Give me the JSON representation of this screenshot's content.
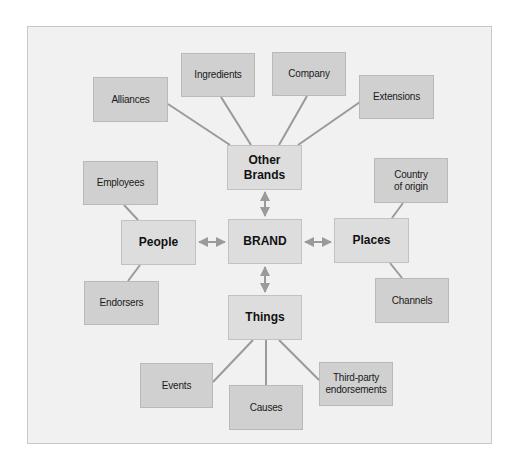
{
  "diagram": {
    "center": {
      "label": "BRAND"
    },
    "hubs": {
      "other_brands": {
        "label": "Other\nBrands"
      },
      "people": {
        "label": "People"
      },
      "places": {
        "label": "Places"
      },
      "things": {
        "label": "Things"
      }
    },
    "leaves": {
      "alliances": {
        "label": "Alliances",
        "parent": "Other Brands"
      },
      "ingredients": {
        "label": "Ingredients",
        "parent": "Other Brands"
      },
      "company": {
        "label": "Company",
        "parent": "Other Brands"
      },
      "extensions": {
        "label": "Extensions",
        "parent": "Other Brands"
      },
      "employees": {
        "label": "Employees",
        "parent": "People"
      },
      "endorsers": {
        "label": "Endorsers",
        "parent": "People"
      },
      "country_of_origin": {
        "label": "Country\nof origin",
        "parent": "Places"
      },
      "channels": {
        "label": "Channels",
        "parent": "Places"
      },
      "events": {
        "label": "Events",
        "parent": "Things"
      },
      "causes": {
        "label": "Causes",
        "parent": "Things"
      },
      "third_party": {
        "label": "Third-party\nendorsements",
        "parent": "Things"
      }
    },
    "colors": {
      "background": "#f1f1f1",
      "outer_box": "#d0d0d0",
      "inner_box": "#dddddd",
      "connector": "#9a9a9a"
    }
  }
}
